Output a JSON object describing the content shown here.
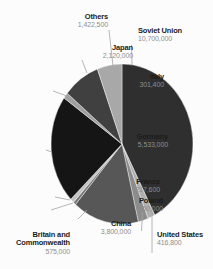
{
  "chart_data": {
    "type": "pie",
    "title": "",
    "legend_position": "none",
    "direction": "clockwise",
    "start_angle_deg": 0,
    "total": 25246300,
    "colors": {
      "background": "#fcfcfc",
      "leader_line": "#a3a3a3",
      "slice_separator": "#ffffff",
      "label_name": "#1b1b1b",
      "label_value": "#8e8e8e"
    },
    "slices": [
      {
        "id": "soviet-union",
        "label": "Soviet Union",
        "value": 10700000,
        "value_text": "10,700,000",
        "color": "#2f2f2f"
      },
      {
        "id": "united-states",
        "label": "United States",
        "value": 416800,
        "value_text": "416,800",
        "color": "#b0b0b0"
      },
      {
        "id": "britain",
        "label": "Britain and Commonwealth",
        "value": 575000,
        "value_text": "575,000",
        "color": "#8c8c8c"
      },
      {
        "id": "china",
        "label": "China",
        "value": 3800000,
        "value_text": "3,800,000",
        "color": "#575757"
      },
      {
        "id": "poland",
        "label": "Poland",
        "value": 160000,
        "value_text": "160,000",
        "color": "#787878"
      },
      {
        "id": "france",
        "label": "France",
        "value": 217600,
        "value_text": "217,600",
        "color": "#c4c4c4"
      },
      {
        "id": "germany",
        "label": "Germany",
        "value": 5533000,
        "value_text": "5,533,000",
        "color": "#151515"
      },
      {
        "id": "italy",
        "label": "Italy",
        "value": 301400,
        "value_text": "301,400",
        "color": "#a0a0a0"
      },
      {
        "id": "japan",
        "label": "Japan",
        "value": 2120000,
        "value_text": "2,120,000",
        "color": "#404040"
      },
      {
        "id": "others",
        "label": "Others",
        "value": 1422500,
        "value_text": "1,422,500",
        "color": "#a8a8a8"
      }
    ]
  }
}
